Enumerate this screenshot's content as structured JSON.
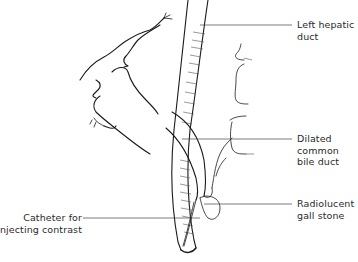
{
  "figure": {
    "type": "anatomical line drawing"
  },
  "labels": [
    {
      "id": "left-hepatic-duct",
      "lines": [
        "Left hepatic",
        "duct"
      ],
      "text": "Left hepatic\nduct"
    },
    {
      "id": "dilated-common-bile-duct",
      "lines": [
        "Dilated",
        "common",
        "bile duct"
      ],
      "text": "Dilated\ncommon\nbile duct"
    },
    {
      "id": "radiolucent-gall-stone",
      "lines": [
        "Radiolucent",
        "gall stone"
      ],
      "text": "Radiolucent\ngall stone"
    },
    {
      "id": "catheter",
      "lines": [
        "Catheter for",
        "injecting contrast"
      ],
      "text": "Catheter for\ninjecting contrast"
    }
  ],
  "colors": {
    "background": "#ffffff",
    "line": "#1a1a1a",
    "text": "#2a2a2a"
  }
}
